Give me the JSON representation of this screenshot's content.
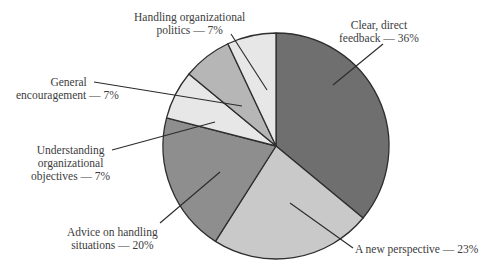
{
  "chart_data": {
    "type": "pie",
    "title": "",
    "start_angle_deg": 0,
    "direction": "clockwise",
    "center": [
      276,
      146
    ],
    "radius": 113,
    "outline_color": "#2e2e2e",
    "slices": [
      {
        "label": "Clear, direct feedback",
        "value": 36,
        "color": "#6f6f6f",
        "leader": {
          "from": [
            333,
            85
          ],
          "to": [
            383,
            44
          ]
        }
      },
      {
        "label": "A new perspective",
        "value": 23,
        "color": "#c9c9c9",
        "leader": {
          "from": [
            290,
            203
          ],
          "to": [
            353,
            248
          ]
        }
      },
      {
        "label": "Advice on handling situations",
        "value": 20,
        "color": "#8e8e8e",
        "leader": {
          "from": [
            220,
            172
          ],
          "to": [
            160,
            223
          ]
        }
      },
      {
        "label": "Understanding organizational objectives",
        "value": 7,
        "color": "#e7e7e7",
        "leader": {
          "from": [
            215,
            122
          ],
          "to": [
            112,
            150
          ]
        }
      },
      {
        "label": "General encouragement",
        "value": 7,
        "color": "#b6b6b6",
        "leader": {
          "from": [
            242,
            106
          ],
          "to": [
            94,
            82
          ]
        }
      },
      {
        "label": "Handling organizational politics",
        "value": 7,
        "color": "#e7e7e7",
        "leader": {
          "from": [
            267,
            90
          ],
          "to": [
            231,
            34
          ]
        }
      }
    ]
  },
  "labels": {
    "feedback": {
      "line1": "Clear, direct",
      "line2": "feedback — 36%"
    },
    "perspective": {
      "line1": "A new perspective — 23%"
    },
    "advice": {
      "line1": "Advice on handling",
      "line2": "situations — 20%"
    },
    "understanding": {
      "line1": "Understanding",
      "line2": "organizational",
      "line3": "objectives — 7%"
    },
    "encouragement": {
      "line1": "General",
      "line2": "encouragement — 7%"
    },
    "politics": {
      "line1": "Handling organizational",
      "line2": "politics — 7%"
    }
  }
}
